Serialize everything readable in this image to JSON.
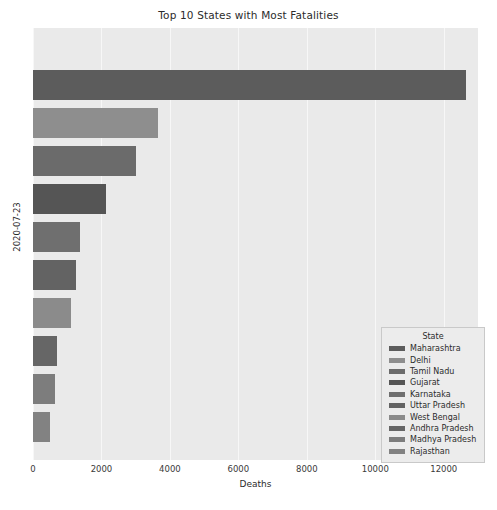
{
  "chart_data": {
    "type": "bar",
    "orientation": "horizontal",
    "title": "Top 10 States with Most Fatalities",
    "xlabel": "Deaths",
    "ylabel": "2020-07-23",
    "legend_title": "State",
    "legend_position": "lower right",
    "grid": true,
    "xlim": [
      0,
      13000
    ],
    "xticks": [
      0,
      2000,
      4000,
      6000,
      8000,
      10000,
      12000
    ],
    "xtick_labels": [
      "0",
      "2000",
      "4000",
      "6000",
      "8000",
      "10000",
      "12000"
    ],
    "categories": [
      "Maharashtra",
      "Delhi",
      "Tamil Nadu",
      "Gujarat",
      "Karnataka",
      "Uttar Pradesh",
      "West Bengal",
      "Andhra Pradesh",
      "Madhya Pradesh",
      "Rajasthan"
    ],
    "values": [
      12640,
      3665,
      3020,
      2140,
      1380,
      1260,
      1115,
      710,
      645,
      500
    ],
    "colors": [
      "#5c5c5c",
      "#8e8e8e",
      "#6b6b6b",
      "#555555",
      "#6f6f6f",
      "#636363",
      "#8b8b8b",
      "#666666",
      "#7d7d7d",
      "#828282"
    ],
    "plot_background": "#eaeaea",
    "grid_color": "#f7f7f7"
  }
}
